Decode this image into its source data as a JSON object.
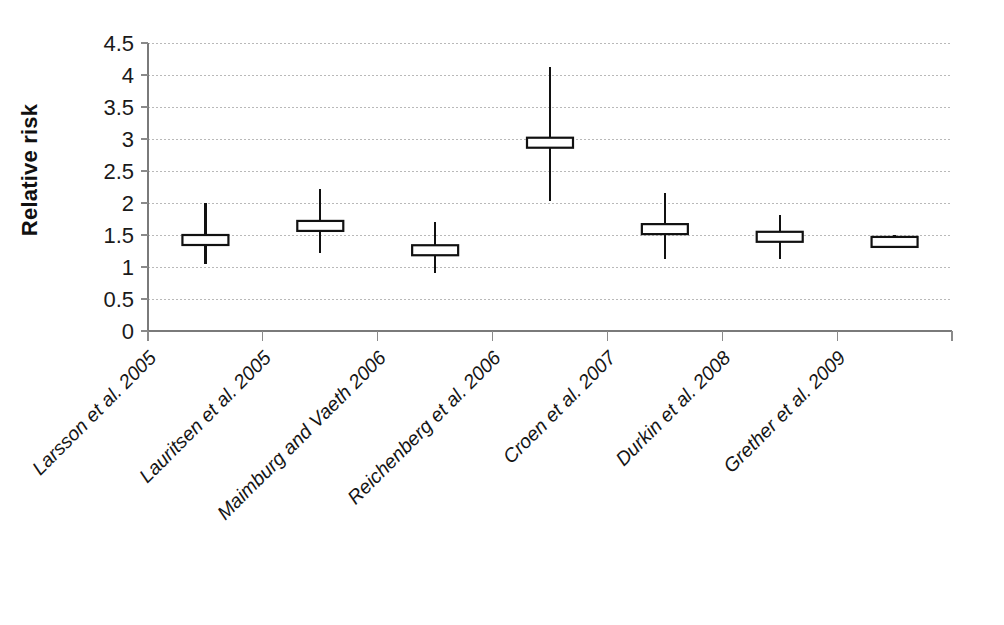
{
  "chart_data": {
    "type": "bar",
    "subtype": "box-whisker-forest-plot",
    "title": "",
    "xlabel": "",
    "ylabel": "Relative risk",
    "ylim": [
      0,
      4.5
    ],
    "y_tick_labels": [
      "0",
      "0.5",
      "1",
      "1.5",
      "2",
      "2.5",
      "3",
      "3.5",
      "4",
      "4.5"
    ],
    "y_tick_values": [
      0,
      0.5,
      1,
      1.5,
      2,
      2.5,
      3,
      3.5,
      4,
      4.5
    ],
    "grid": true,
    "legend": "none",
    "categories": [
      "Larsson et al. 2005",
      "Lauritsen et al. 2005",
      "Maimburg and Vaeth 2006",
      "Reichenberg et al. 2006",
      "Croen et al. 2007",
      "Durkin et al. 2008",
      "Grether et al. 2009"
    ],
    "values": [
      1.45,
      1.65,
      1.28,
      2.95,
      1.6,
      1.5,
      1.42
    ],
    "series": [
      {
        "name": "Relative risk",
        "values": [
          1.45,
          1.65,
          1.28,
          2.95,
          1.6,
          1.5,
          1.42
        ]
      }
    ],
    "points": [
      {
        "category": "Larsson et al. 2005",
        "estimate": 1.45,
        "box_low": 1.4,
        "box_high": 1.5,
        "whisker_low": 1.05,
        "whisker_high": 2.0
      },
      {
        "category": "Lauritsen et al. 2005",
        "estimate": 1.65,
        "box_low": 1.59,
        "box_high": 1.72,
        "whisker_low": 1.22,
        "whisker_high": 2.22
      },
      {
        "category": "Maimburg and Vaeth 2006",
        "estimate": 1.28,
        "box_low": 1.23,
        "box_high": 1.34,
        "whisker_low": 0.9,
        "whisker_high": 1.7
      },
      {
        "category": "Reichenberg et al. 2006",
        "estimate": 2.95,
        "box_low": 2.88,
        "box_high": 3.02,
        "whisker_low": 2.03,
        "whisker_high": 4.13
      },
      {
        "category": "Croen et al. 2007",
        "estimate": 1.6,
        "box_low": 1.54,
        "box_high": 1.67,
        "whisker_low": 1.13,
        "whisker_high": 2.15
      },
      {
        "category": "Durkin et al. 2008",
        "estimate": 1.5,
        "box_low": 1.45,
        "box_high": 1.55,
        "whisker_low": 1.13,
        "whisker_high": 1.82
      },
      {
        "category": "Grether et al. 2009",
        "estimate": 1.42,
        "box_low": 1.38,
        "box_high": 1.47,
        "whisker_low": 1.33,
        "whisker_high": 1.5
      }
    ]
  },
  "axes": {
    "y_title": "Relative risk"
  },
  "colors": {
    "background": "#ffffff",
    "gridline": "#b9b9b9",
    "axis": "#7a7a7a",
    "marker_stroke": "#111111",
    "box_fill": "#ffffff",
    "text": "#1a1a1a"
  }
}
